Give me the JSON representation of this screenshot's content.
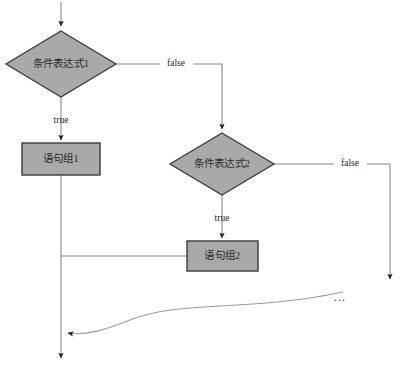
{
  "diagram": {
    "type": "flowchart",
    "colors": {
      "node_fill": "#a9a9a9",
      "node_stroke": "#3b3b3b",
      "line": "#808080",
      "text": "#2b2b2b",
      "label_text": "#1c1c1c",
      "background": "#ffffff"
    },
    "nodes": [
      {
        "id": "cond1",
        "shape": "diamond",
        "label": "条件表达式1",
        "cx": 61,
        "cy": 64,
        "rx": 55,
        "ry": 33
      },
      {
        "id": "stmt1",
        "shape": "rectangle",
        "label": "语句组1",
        "x": 22,
        "y": 143,
        "w": 78,
        "h": 32
      },
      {
        "id": "cond2",
        "shape": "diamond",
        "label": "条件表达式2",
        "cx": 222,
        "cy": 164,
        "rx": 52,
        "ry": 31
      },
      {
        "id": "stmt2",
        "shape": "rectangle",
        "label": "语句组2",
        "x": 187,
        "y": 241,
        "w": 71,
        "h": 30
      }
    ],
    "edge_labels": [
      {
        "id": "false1",
        "text": "false",
        "x": 176,
        "y": 64
      },
      {
        "id": "true1",
        "text": "true",
        "x": 61,
        "y": 121
      },
      {
        "id": "false2",
        "text": "false",
        "x": 350,
        "y": 164
      },
      {
        "id": "true2",
        "text": "true",
        "x": 222,
        "y": 219
      }
    ],
    "annotations": [
      {
        "id": "continuation-ellipsis",
        "text": "...",
        "x": 340,
        "y": 298
      }
    ],
    "endpoints": [
      {
        "id": "entry-arrow",
        "x": 61,
        "y": 8
      },
      {
        "id": "exit-arrow-main",
        "x": 61,
        "y": 362
      },
      {
        "id": "exit-arrow-right",
        "x": 390,
        "y": 285
      }
    ]
  }
}
